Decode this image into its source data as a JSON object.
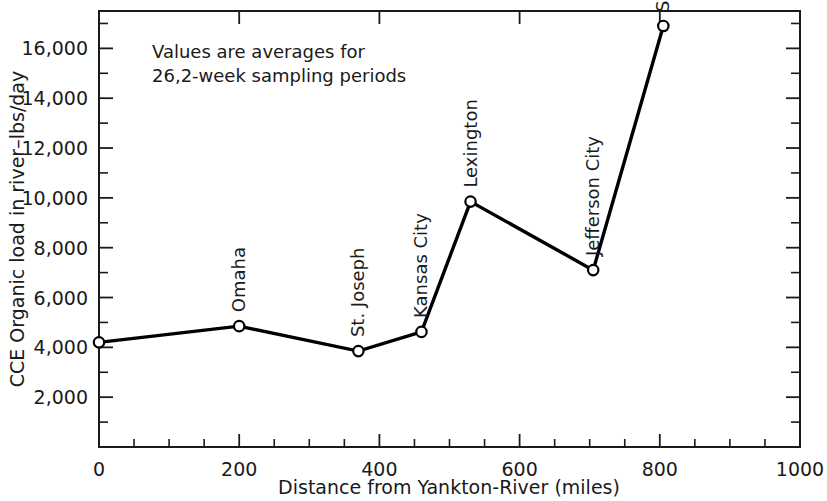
{
  "chart_data": {
    "type": "line",
    "title": "",
    "xlabel": "Distance from Yankton-River (miles)",
    "ylabel": "CCE Organic load in river–lbs/day",
    "xlim": [
      0,
      1000
    ],
    "ylim": [
      0,
      17500
    ],
    "grid": false,
    "legend": "none",
    "annotations": [
      "Values are averages for",
      "26,2-week sampling periods"
    ],
    "x_ticks": [
      0,
      200,
      400,
      600,
      800,
      1000
    ],
    "x_tick_labels": [
      "0",
      "200",
      "400",
      "600",
      "800",
      "1000"
    ],
    "x_minor_tick_interval": 50,
    "y_ticks": [
      2000,
      4000,
      6000,
      8000,
      10000,
      12000,
      14000,
      16000
    ],
    "y_tick_labels": [
      "2,000",
      "4,000",
      "6,000",
      "8,000",
      "10,000",
      "12,000",
      "14,000",
      "16,000"
    ],
    "y_minor_tick_interval": 1000,
    "x": [
      0,
      200,
      370,
      460,
      530,
      705,
      805
    ],
    "values": [
      4200,
      4850,
      3850,
      4620,
      9850,
      7100,
      16900
    ],
    "point_labels": [
      "",
      "Omaha",
      "St. Joseph",
      "Kansas City",
      "Lexington",
      "Jefferson City",
      "St. Louis"
    ],
    "series": [
      {
        "name": "CCE Organic load",
        "x": [
          0,
          200,
          370,
          460,
          530,
          705,
          805
        ],
        "values": [
          4200,
          4850,
          3850,
          4620,
          9850,
          7100,
          16900
        ]
      }
    ],
    "colors": {
      "line": "#000000",
      "marker_fill": "#ffffff",
      "marker_stroke": "#000000",
      "axis": "#1a1a1a",
      "text": "#1a1a1a",
      "background": "#ffffff"
    }
  }
}
